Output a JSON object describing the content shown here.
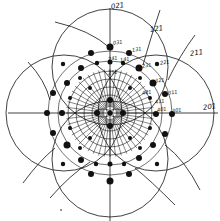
{
  "diagram": {
    "type": "stereographic-projection",
    "center": [
      110,
      113
    ],
    "colors": {
      "ink": "#111111",
      "paper": "#ffffff"
    },
    "axes": {
      "vertical": {
        "x": 110,
        "y1": 8,
        "y2": 221
      },
      "horizontal": {
        "y": 113,
        "x1": 8,
        "x2": 218
      }
    },
    "big_circles": [
      {
        "cx": 110,
        "cy": 67,
        "r": 58
      },
      {
        "cx": 156,
        "cy": 113,
        "r": 58
      },
      {
        "cx": 110,
        "cy": 159,
        "r": 58
      },
      {
        "cx": 64,
        "cy": 113,
        "r": 58
      }
    ],
    "inner_rings": [
      {
        "r": 18
      },
      {
        "r": 26
      },
      {
        "r": 34
      },
      {
        "r": 42
      },
      {
        "r": 52
      },
      {
        "r": 62
      }
    ],
    "outer_arcs": [
      {
        "d": "M 55 22 Q 90 30 110 48"
      },
      {
        "d": "M 28 62 Q 45 80 50 100"
      },
      {
        "d": "M 160 10 Q 150 40 143 65"
      },
      {
        "d": "M 195 35 Q 180 55 168 80"
      },
      {
        "d": "M 23 183 Q 40 160 55 148"
      },
      {
        "d": "M 50 198 Q 70 175 90 162"
      },
      {
        "d": "M 200 190 Q 185 160 165 145"
      },
      {
        "d": "M 175 205 Q 150 180 135 168"
      }
    ],
    "dots": [
      {
        "x": 110,
        "y": 47,
        "r": 3.5
      },
      {
        "x": 129,
        "y": 53,
        "r": 3
      },
      {
        "x": 91,
        "y": 53,
        "r": 3
      },
      {
        "x": 139,
        "y": 68,
        "r": 3.5
      },
      {
        "x": 81,
        "y": 68,
        "r": 3
      },
      {
        "x": 157,
        "y": 64,
        "r": 2.2
      },
      {
        "x": 63,
        "y": 64,
        "r": 2.2
      },
      {
        "x": 153,
        "y": 83,
        "r": 3.5
      },
      {
        "x": 67,
        "y": 83,
        "r": 3
      },
      {
        "x": 165,
        "y": 94,
        "r": 3
      },
      {
        "x": 53,
        "y": 93,
        "r": 3
      },
      {
        "x": 172,
        "y": 114,
        "r": 3
      },
      {
        "x": 47,
        "y": 113,
        "r": 3
      },
      {
        "x": 156,
        "y": 114,
        "r": 3
      },
      {
        "x": 62,
        "y": 113,
        "r": 3
      },
      {
        "x": 165,
        "y": 134,
        "r": 3
      },
      {
        "x": 53,
        "y": 133,
        "r": 3
      },
      {
        "x": 153,
        "y": 145,
        "r": 3
      },
      {
        "x": 67,
        "y": 145,
        "r": 3.5
      },
      {
        "x": 139,
        "y": 158,
        "r": 3
      },
      {
        "x": 81,
        "y": 160,
        "r": 3
      },
      {
        "x": 157,
        "y": 164,
        "r": 2.2
      },
      {
        "x": 63,
        "y": 164,
        "r": 2.2
      },
      {
        "x": 129,
        "y": 174,
        "r": 3
      },
      {
        "x": 91,
        "y": 174,
        "r": 3
      },
      {
        "x": 110,
        "y": 181,
        "r": 3.5
      },
      {
        "x": 110,
        "y": 164,
        "r": 2.5
      },
      {
        "x": 96,
        "y": 164,
        "r": 2.2
      },
      {
        "x": 124,
        "y": 164,
        "r": 2.2
      },
      {
        "x": 110,
        "y": 62,
        "r": 2.5
      },
      {
        "x": 97,
        "y": 63,
        "r": 2.2
      },
      {
        "x": 123,
        "y": 63,
        "r": 2.2
      },
      {
        "x": 80,
        "y": 78,
        "r": 2
      },
      {
        "x": 140,
        "y": 78,
        "r": 2
      },
      {
        "x": 70,
        "y": 98,
        "r": 2
      },
      {
        "x": 150,
        "y": 98,
        "r": 2
      },
      {
        "x": 70,
        "y": 128,
        "r": 2
      },
      {
        "x": 150,
        "y": 128,
        "r": 2
      },
      {
        "x": 80,
        "y": 148,
        "r": 2
      },
      {
        "x": 140,
        "y": 148,
        "r": 2
      },
      {
        "x": 90,
        "y": 138,
        "r": 2
      },
      {
        "x": 130,
        "y": 138,
        "r": 2
      },
      {
        "x": 90,
        "y": 88,
        "r": 2
      },
      {
        "x": 130,
        "y": 88,
        "r": 2
      },
      {
        "x": 110,
        "y": 100,
        "r": 3
      },
      {
        "x": 110,
        "y": 126,
        "r": 3
      },
      {
        "x": 97,
        "y": 113,
        "r": 3
      },
      {
        "x": 123,
        "y": 113,
        "r": 3
      },
      {
        "x": 61,
        "y": 210,
        "r": 0.8
      }
    ],
    "labels": [
      {
        "text": "021",
        "x": 111,
        "y": 3,
        "size": "normal"
      },
      {
        "text": "031",
        "x": 113,
        "y": 40,
        "size": "small"
      },
      {
        "text": "131",
        "x": 132,
        "y": 47,
        "size": "small"
      },
      {
        "text": "121",
        "x": 150,
        "y": 26,
        "size": "normal"
      },
      {
        "text": "141",
        "x": 120,
        "y": 57,
        "size": "small"
      },
      {
        "text": "241",
        "x": 108,
        "y": 56,
        "size": "small"
      },
      {
        "text": "231",
        "x": 142,
        "y": 63,
        "size": "small"
      },
      {
        "text": "221",
        "x": 160,
        "y": 60,
        "size": "small"
      },
      {
        "text": "211",
        "x": 190,
        "y": 50,
        "size": "normal"
      },
      {
        "text": "251",
        "x": 108,
        "y": 70,
        "size": "small"
      },
      {
        "text": "321",
        "x": 155,
        "y": 78,
        "size": "small"
      },
      {
        "text": "311",
        "x": 168,
        "y": 90,
        "size": "small"
      },
      {
        "text": "411",
        "x": 155,
        "y": 99,
        "size": "small"
      },
      {
        "text": "421",
        "x": 142,
        "y": 90,
        "size": "small"
      },
      {
        "text": "401",
        "x": 157,
        "y": 107,
        "size": "small"
      },
      {
        "text": "301",
        "x": 172,
        "y": 108,
        "size": "small"
      },
      {
        "text": "201",
        "x": 203,
        "y": 104,
        "size": "normal"
      }
    ],
    "spoke_groups": {
      "count_per_lobe": 12,
      "lobe_centers": [
        [
          110,
          100
        ],
        [
          123,
          113
        ],
        [
          110,
          126
        ],
        [
          97,
          113
        ]
      ]
    }
  }
}
